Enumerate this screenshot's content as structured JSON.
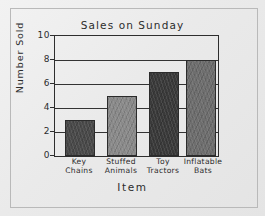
{
  "chart_data": {
    "type": "bar",
    "title": "Sales on Sunday",
    "xlabel": "Item",
    "ylabel": "Number Sold",
    "categories": [
      "Key Chains",
      "Stuffed Animals",
      "Toy Tractors",
      "Inflatable Bats"
    ],
    "values": [
      3,
      5,
      7,
      8
    ],
    "ylim": [
      0,
      10
    ],
    "yticks": [
      10,
      8,
      6,
      4,
      2,
      0
    ],
    "grid": true,
    "legend": "none",
    "bar_colors": [
      "#4a4a4a",
      "#8a8a8a",
      "#3a3a3a",
      "#6e6e6e"
    ],
    "style": "hand-drawn pencil on paper",
    "background_color": "#eeeeee",
    "axis_color": "#2e2e2e"
  },
  "category_lines": [
    [
      "Key",
      "Chains"
    ],
    [
      "Stuffed",
      "Animals"
    ],
    [
      "Toy",
      "Tractors"
    ],
    [
      "Inflatable",
      "Bats"
    ]
  ]
}
